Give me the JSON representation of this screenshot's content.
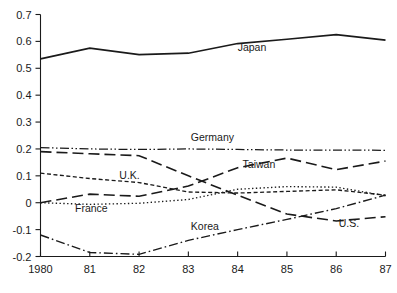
{
  "chart_data": {
    "type": "line",
    "title": "",
    "subtitle": "",
    "xlabel": "",
    "ylabel": "",
    "xlim": [
      1980,
      1987
    ],
    "ylim": [
      -0.2,
      0.7
    ],
    "grid": false,
    "legend_position": "inline-labels",
    "x": [
      1980,
      1981,
      1982,
      1983,
      1984,
      1985,
      1986,
      1987
    ],
    "x_tick_labels": [
      "1980",
      "81",
      "82",
      "83",
      "84",
      "85",
      "86",
      "87"
    ],
    "y_ticks": [
      -0.2,
      -0.1,
      0,
      0.1,
      0.2,
      0.3,
      0.4,
      0.5,
      0.6,
      0.7
    ],
    "y_tick_labels": [
      "-0.2",
      "-0.1",
      "0",
      "0.1",
      "0.2",
      "0.3",
      "0.4",
      "0.5",
      "0.6",
      "0.7"
    ],
    "series": [
      {
        "name": "Japan",
        "style": "solid",
        "dash": "none",
        "width": 1.7,
        "color": "#1a1a1a",
        "values": [
          0.535,
          0.575,
          0.551,
          0.556,
          0.592,
          0.608,
          0.625,
          0.605
        ],
        "label": "Japan",
        "label_x": 1984.0,
        "label_y": 0.565
      },
      {
        "name": "Germany",
        "style": "dash-dot-dot",
        "dash": "9,2.5,1.5,2.5,1.5,2.5",
        "width": 1.25,
        "color": "#1a1a1a",
        "values": [
          0.205,
          0.2,
          0.198,
          0.2,
          0.198,
          0.196,
          0.196,
          0.195
        ],
        "label": "Germany",
        "label_x": 1983.05,
        "label_y": 0.228
      },
      {
        "name": "Taiwan",
        "style": "long-dash",
        "dash": "11,5",
        "width": 1.6,
        "color": "#1a1a1a",
        "values": [
          0.0,
          0.032,
          0.024,
          0.062,
          0.13,
          0.166,
          0.123,
          0.155
        ],
        "label": "Taiwan",
        "label_x": 1984.1,
        "label_y": 0.128
      },
      {
        "name": "U.S.",
        "style": "long-dash",
        "dash": "11,5",
        "width": 1.6,
        "color": "#1a1a1a",
        "values": [
          0.19,
          0.182,
          0.175,
          0.1,
          0.028,
          -0.042,
          -0.068,
          -0.052
        ],
        "label": "U.S.",
        "label_x": 1986.05,
        "label_y": -0.092
      },
      {
        "name": "U.K.",
        "style": "short-dash",
        "dash": "4,2.5",
        "width": 1.35,
        "color": "#1a1a1a",
        "values": [
          0.11,
          0.09,
          0.075,
          0.04,
          0.036,
          0.042,
          0.048,
          0.028
        ],
        "label": "U.K.",
        "label_x": 1981.6,
        "label_y": 0.088
      },
      {
        "name": "France",
        "style": "dotted",
        "dash": "1.4,2.4",
        "width": 1.35,
        "color": "#1a1a1a",
        "values": [
          0.0,
          -0.006,
          -0.002,
          0.012,
          0.05,
          0.06,
          0.058,
          0.026
        ],
        "label": "France",
        "label_x": 1980.7,
        "label_y": -0.034
      },
      {
        "name": "Korea",
        "style": "dash-dot",
        "dash": "9,3,1.6,3",
        "width": 1.4,
        "color": "#1a1a1a",
        "values": [
          -0.12,
          -0.185,
          -0.192,
          -0.14,
          -0.1,
          -0.062,
          -0.022,
          0.028
        ],
        "label": "Korea",
        "label_x": 1983.05,
        "label_y": -0.1
      }
    ]
  },
  "figure": {
    "background_color": "#ffffff",
    "ink_color": "#1a1a1a"
  }
}
